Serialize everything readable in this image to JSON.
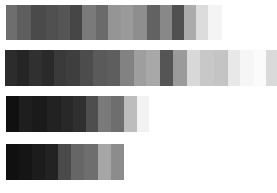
{
  "strips": [
    {
      "name": "swatch-strip-1",
      "left": 6,
      "top": 5,
      "height": 35,
      "segments": [
        {
          "w": 11,
          "c": "#6e6e6e"
        },
        {
          "w": 14,
          "c": "#5e5e5e"
        },
        {
          "w": 15,
          "c": "#4a4a4a"
        },
        {
          "w": 12,
          "c": "#505050"
        },
        {
          "w": 12,
          "c": "#555555"
        },
        {
          "w": 12,
          "c": "#464646"
        },
        {
          "w": 14,
          "c": "#7a7a7a"
        },
        {
          "w": 12,
          "c": "#6a6a6a"
        },
        {
          "w": 13,
          "c": "#959595"
        },
        {
          "w": 12,
          "c": "#9a9a9a"
        },
        {
          "w": 14,
          "c": "#8e8e8e"
        },
        {
          "w": 13,
          "c": "#626262"
        },
        {
          "w": 12,
          "c": "#888888"
        },
        {
          "w": 12,
          "c": "#505050"
        },
        {
          "w": 12,
          "c": "#ababab"
        },
        {
          "w": 12,
          "c": "#dcdcdc"
        },
        {
          "w": 14,
          "c": "#f4f4f4"
        }
      ]
    },
    {
      "name": "swatch-strip-2",
      "left": 5,
      "top": 50,
      "height": 36,
      "segments": [
        {
          "w": 12,
          "c": "#2c2c2c"
        },
        {
          "w": 12,
          "c": "#252525"
        },
        {
          "w": 13,
          "c": "#303030"
        },
        {
          "w": 12,
          "c": "#2a2a2a"
        },
        {
          "w": 12,
          "c": "#3a3a3a"
        },
        {
          "w": 14,
          "c": "#3e3e3e"
        },
        {
          "w": 13,
          "c": "#4c4c4c"
        },
        {
          "w": 14,
          "c": "#5a5a5a"
        },
        {
          "w": 13,
          "c": "#5e5e5e"
        },
        {
          "w": 14,
          "c": "#828282"
        },
        {
          "w": 12,
          "c": "#9e9e9e"
        },
        {
          "w": 14,
          "c": "#a8a8a8"
        },
        {
          "w": 13,
          "c": "#555555"
        },
        {
          "w": 14,
          "c": "#9a9a9a"
        },
        {
          "w": 13,
          "c": "#d8d8d8"
        },
        {
          "w": 14,
          "c": "#c8c8c8"
        },
        {
          "w": 14,
          "c": "#c4c4c4"
        },
        {
          "w": 12,
          "c": "#e8e8e8"
        },
        {
          "w": 14,
          "c": "#f6f6f6"
        },
        {
          "w": 12,
          "c": "#fbfbfb"
        },
        {
          "w": 13,
          "c": "#dadada"
        },
        {
          "w": 6,
          "c": "#f2f2f2"
        }
      ]
    },
    {
      "name": "swatch-strip-3",
      "left": 6,
      "top": 96,
      "height": 36,
      "segments": [
        {
          "w": 13,
          "c": "#101010"
        },
        {
          "w": 13,
          "c": "#1e1e1e"
        },
        {
          "w": 15,
          "c": "#1a1a1a"
        },
        {
          "w": 14,
          "c": "#222222"
        },
        {
          "w": 12,
          "c": "#282828"
        },
        {
          "w": 13,
          "c": "#303030"
        },
        {
          "w": 12,
          "c": "#4e4e4e"
        },
        {
          "w": 13,
          "c": "#7a7a7a"
        },
        {
          "w": 13,
          "c": "#6e6e6e"
        },
        {
          "w": 13,
          "c": "#bdbdbd"
        },
        {
          "w": 12,
          "c": "#f2f2f2"
        }
      ]
    },
    {
      "name": "swatch-strip-4",
      "left": 6,
      "top": 144,
      "height": 36,
      "segments": [
        {
          "w": 13,
          "c": "#101010"
        },
        {
          "w": 13,
          "c": "#151515"
        },
        {
          "w": 13,
          "c": "#1c1c1c"
        },
        {
          "w": 13,
          "c": "#222222"
        },
        {
          "w": 13,
          "c": "#4a4a4a"
        },
        {
          "w": 13,
          "c": "#666666"
        },
        {
          "w": 14,
          "c": "#6e6e6e"
        },
        {
          "w": 13,
          "c": "#a6a6a6"
        },
        {
          "w": 13,
          "c": "#8c8c8c"
        }
      ]
    }
  ]
}
